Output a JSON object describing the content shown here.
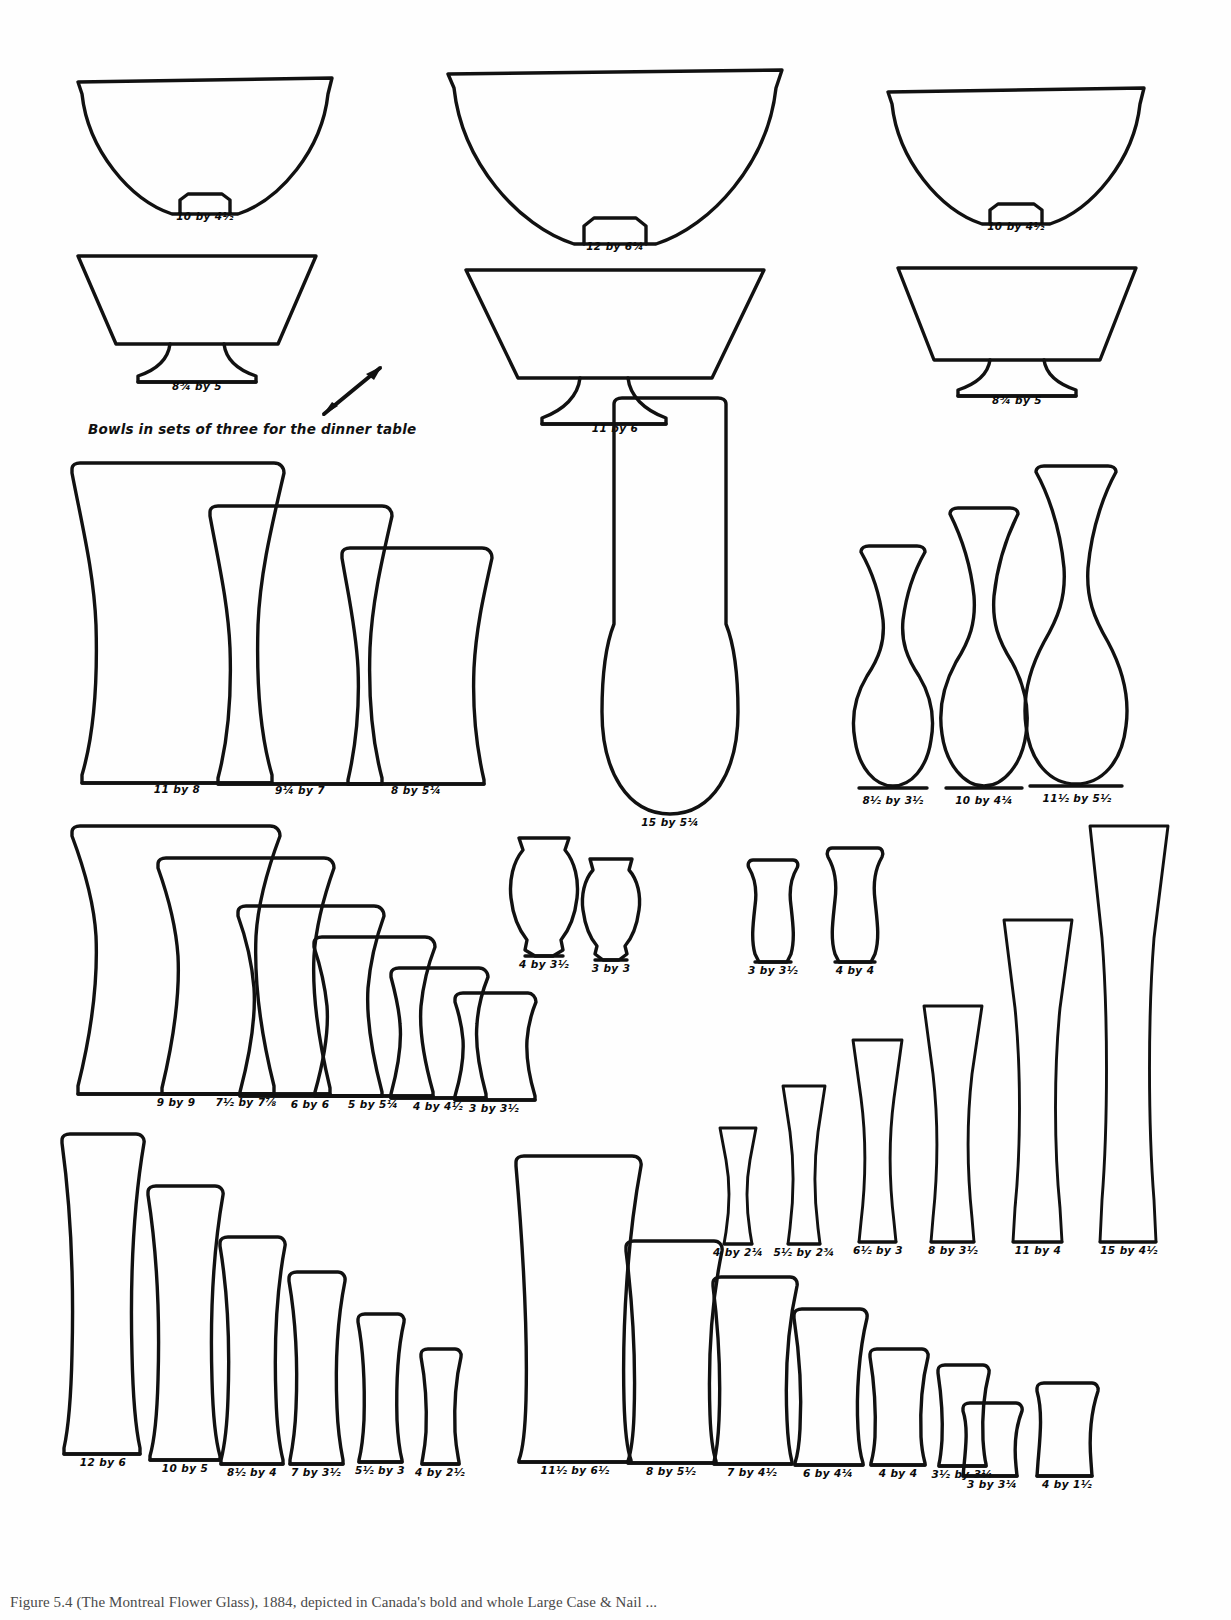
{
  "figure": {
    "caption_note": "Bowls in sets of three for the dinner table",
    "bottom_caption": "Figure 5.4     (The Montreal Flower Glass), 1884, depicted in Canada's bold and whole Large Case & Nail ..."
  },
  "groups": [
    {
      "name": "dinner-bowls",
      "items": [
        {
          "id": "bowl-l-1",
          "label": "10 by 4½",
          "shape": "bowl-round"
        },
        {
          "id": "bowl-l-2",
          "label": "8¾ by 5",
          "shape": "bowl-footed"
        },
        {
          "id": "bowl-c-1",
          "label": "12 by 6¼",
          "shape": "bowl-round"
        },
        {
          "id": "bowl-c-2",
          "label": "11 by 6",
          "shape": "bowl-footed"
        },
        {
          "id": "bowl-r-1",
          "label": "10 by 4½",
          "shape": "bowl-round"
        },
        {
          "id": "bowl-r-2",
          "label": "8¾ by 5",
          "shape": "bowl-footed"
        }
      ]
    },
    {
      "name": "celery-vases-large",
      "items": [
        {
          "id": "cv-1",
          "label": "11 by 8"
        },
        {
          "id": "cv-2",
          "label": "9¼ by 7"
        },
        {
          "id": "cv-3",
          "label": "8 by 5¼"
        }
      ]
    },
    {
      "name": "tall-center-vase",
      "items": [
        {
          "id": "tcv-1",
          "label": "15 by 5¼"
        }
      ]
    },
    {
      "name": "slender-vases",
      "items": [
        {
          "id": "sv-1",
          "label": "8½ by 3½"
        },
        {
          "id": "sv-2",
          "label": "10 by 4¼"
        },
        {
          "id": "sv-3",
          "label": "11½ by 5½"
        }
      ]
    },
    {
      "name": "graduated-jars",
      "items": [
        {
          "id": "gj-1",
          "label": "9 by 9"
        },
        {
          "id": "gj-2",
          "label": "7½ by 7⅞"
        },
        {
          "id": "gj-3",
          "label": "6 by 6"
        },
        {
          "id": "gj-4",
          "label": "5 by 5¼"
        },
        {
          "id": "gj-5",
          "label": "4 by 4½"
        },
        {
          "id": "gj-6",
          "label": "3 by 3½"
        }
      ]
    },
    {
      "name": "small-pots-left",
      "items": [
        {
          "id": "sp-1",
          "label": "4 by 3½"
        },
        {
          "id": "sp-2",
          "label": "3 by 3"
        }
      ]
    },
    {
      "name": "small-pots-right",
      "items": [
        {
          "id": "sp-3",
          "label": "3 by 3½"
        },
        {
          "id": "sp-4",
          "label": "4 by 4"
        }
      ]
    },
    {
      "name": "graduated-spills",
      "items": [
        {
          "id": "gs-1",
          "label": "4 by 2¼"
        },
        {
          "id": "gs-2",
          "label": "5½ by 2¾"
        },
        {
          "id": "gs-3",
          "label": "6½ by 3"
        },
        {
          "id": "gs-4",
          "label": "8 by 3½"
        },
        {
          "id": "gs-5",
          "label": "11 by 4"
        },
        {
          "id": "gs-6",
          "label": "15 by 4½"
        }
      ]
    },
    {
      "name": "graduated-tumblers-left",
      "items": [
        {
          "id": "gt-1",
          "label": "12 by 6"
        },
        {
          "id": "gt-2",
          "label": "10 by 5"
        },
        {
          "id": "gt-3",
          "label": "8½ by 4"
        },
        {
          "id": "gt-4",
          "label": "7 by 3½"
        },
        {
          "id": "gt-5",
          "label": "5½ by 3"
        },
        {
          "id": "gt-6",
          "label": "4 by 2½"
        }
      ]
    },
    {
      "name": "graduated-tumblers-center",
      "items": [
        {
          "id": "gc-1",
          "label": "11½ by 6½"
        },
        {
          "id": "gc-2",
          "label": "8 by 5½"
        },
        {
          "id": "gc-3",
          "label": "7 by 4½"
        },
        {
          "id": "gc-4",
          "label": "6 by 4¼"
        },
        {
          "id": "gc-5",
          "label": "4 by 4"
        },
        {
          "id": "gc-6",
          "label": "3½ by 3¼"
        }
      ]
    },
    {
      "name": "squat-pair",
      "items": [
        {
          "id": "sq-1",
          "label": "3 by 3¼"
        },
        {
          "id": "sq-2",
          "label": "4 by 1½"
        }
      ]
    }
  ]
}
